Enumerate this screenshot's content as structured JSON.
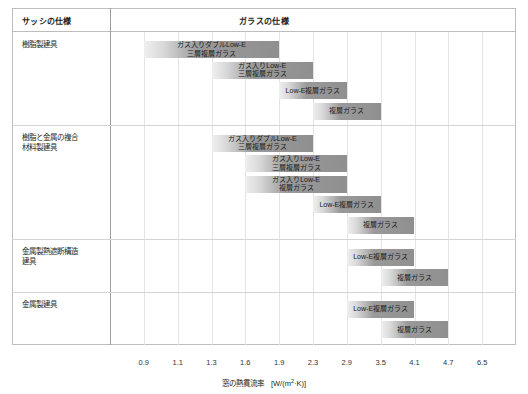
{
  "header": {
    "sash_column_title": "サッシの仕様",
    "glass_column_title": "ガラスの仕様"
  },
  "axis": {
    "title": "窓の熱貫流率　[W/(m²·K)]",
    "title_prefix": "窓の熱貫流率　[W/(m",
    "title_sup": "2",
    "title_suffix": "·K)]",
    "ticks": [
      "0.9",
      "1.1",
      "1.3",
      "1.6",
      "1.9",
      "2.3",
      "2.9",
      "3.5",
      "4.1",
      "4.7",
      "6.5"
    ]
  },
  "chart_data": {
    "type": "bar",
    "orientation": "horizontal",
    "xlabel": "窓の熱貫流率　[W/(m²·K)]",
    "ylabel": "サッシの仕様 / ガラスの仕様",
    "x_tick_labels": [
      "0.9",
      "1.1",
      "1.3",
      "1.6",
      "1.9",
      "2.3",
      "2.9",
      "3.5",
      "4.1",
      "4.7",
      "6.5"
    ],
    "x_scale": "ordinal-nonlinear",
    "grid": true,
    "legend": false,
    "groups": [
      {
        "name": "樹脂製建具",
        "bars": [
          {
            "label": "ガス入りダブルLow-E\n三層複層ガラス",
            "start": "0.9",
            "end": "1.9"
          },
          {
            "label": "ガス入りLow-E\n三層複層ガラス",
            "start": "1.3",
            "end": "2.3"
          },
          {
            "label": "Low-E複層ガラス",
            "start": "1.9",
            "end": "2.9"
          },
          {
            "label": "複層ガラス",
            "start": "2.3",
            "end": "3.5"
          }
        ]
      },
      {
        "name": "樹脂と金属の複合\n材料製建具",
        "bars": [
          {
            "label": "ガス入りダブルLow-E\n三層複層ガラス",
            "start": "1.3",
            "end": "2.3"
          },
          {
            "label": "ガス入りLow-E\n三層複層ガラス",
            "start": "1.6",
            "end": "2.9"
          },
          {
            "label": "ガス入りLow-E\n複層ガラス",
            "start": "1.6",
            "end": "2.9"
          },
          {
            "label": "Low-E複層ガラス",
            "start": "2.3",
            "end": "3.5"
          },
          {
            "label": "複層ガラス",
            "start": "2.9",
            "end": "4.1"
          }
        ]
      },
      {
        "name": "金属製熱遮断構造\n建具",
        "bars": [
          {
            "label": "Low-E複層ガラス",
            "start": "2.9",
            "end": "4.1"
          },
          {
            "label": "複層ガラス",
            "start": "3.5",
            "end": "4.7"
          }
        ]
      },
      {
        "name": "金属製建具",
        "bars": [
          {
            "label": "Low-E複層ガラス",
            "start": "2.9",
            "end": "4.1"
          },
          {
            "label": "複層ガラス",
            "start": "3.5",
            "end": "4.7"
          }
        ]
      }
    ]
  }
}
